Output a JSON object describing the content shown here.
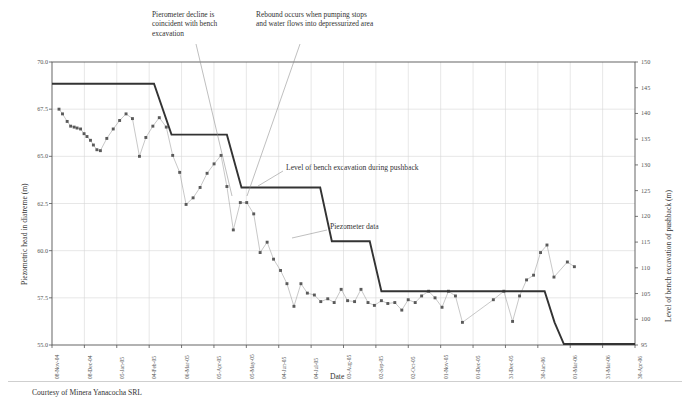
{
  "figure": {
    "credit": "Courtesy of Minera Yanacocha SRL",
    "xlabel": "Date"
  },
  "annotations": {
    "decline": "Pierometer decline is\ncoincident with bench\nexcavation",
    "rebound": "Rebound occurs when pumping stops\nand water flows into depressurized area",
    "bench_label": "Level of bench excavation during pushback",
    "piezo_label": "Piezometer data"
  },
  "chart_data": {
    "type": "line",
    "title": "",
    "xlabel": "Date",
    "ylabel": "Piezometric head in diatreme (m)",
    "y2label": "Level of bench excavation of pushback (m)",
    "ylim": [
      55.0,
      70.0
    ],
    "y2lim": [
      95,
      150
    ],
    "yticks": [
      "55.0",
      "57.5",
      "60.0",
      "62.5",
      "65.0",
      "67.5",
      "70.0"
    ],
    "y2ticks": [
      "95",
      "100",
      "105",
      "110",
      "115",
      "120",
      "125",
      "130",
      "135",
      "140",
      "145",
      "150"
    ],
    "grid": true,
    "legend": "annotated-inline",
    "xticks": [
      "08-Nov-04",
      "08-Dec-04",
      "05-Jan-05",
      "04-Feb-05",
      "06-Mar-05",
      "05-Apr-05",
      "05-May-05",
      "04-Jun-05",
      "04-Jul-05",
      "03-Aug-05",
      "02-Sep-05",
      "02-Oct-05",
      "01-Nov-05",
      "01-Dec-05",
      "31-Dec-05",
      "30-Jan-06",
      "01-Mar-06",
      "31-Mar-06",
      "30-Apr-06"
    ],
    "x_start": "08-Nov-04",
    "x_end": "30-Apr-06",
    "series": [
      {
        "name": "Level of bench excavation during pushback",
        "type": "step",
        "axis": "right",
        "color": "#333333",
        "steps": [
          {
            "x": 0.0,
            "y": 68.85
          },
          {
            "x": 0.175,
            "y": 68.85
          },
          {
            "x": 0.205,
            "y": 66.15
          },
          {
            "x": 0.3,
            "y": 66.15
          },
          {
            "x": 0.325,
            "y": 63.35
          },
          {
            "x": 0.46,
            "y": 63.35
          },
          {
            "x": 0.48,
            "y": 60.5
          },
          {
            "x": 0.545,
            "y": 60.5
          },
          {
            "x": 0.565,
            "y": 57.85
          },
          {
            "x": 0.845,
            "y": 57.85
          },
          {
            "x": 0.862,
            "y": 56.2
          },
          {
            "x": 0.878,
            "y": 55.05
          },
          {
            "x": 1.0,
            "y": 55.05
          }
        ]
      },
      {
        "name": "Piezometer data",
        "type": "scatter-line",
        "axis": "left",
        "color": "#5a5a5a",
        "points": [
          {
            "x": 0.012,
            "y": 67.5
          },
          {
            "x": 0.018,
            "y": 67.25
          },
          {
            "x": 0.026,
            "y": 66.85
          },
          {
            "x": 0.032,
            "y": 66.6
          },
          {
            "x": 0.038,
            "y": 66.55
          },
          {
            "x": 0.043,
            "y": 66.5
          },
          {
            "x": 0.049,
            "y": 66.45
          },
          {
            "x": 0.055,
            "y": 66.2
          },
          {
            "x": 0.06,
            "y": 66.05
          },
          {
            "x": 0.066,
            "y": 65.85
          },
          {
            "x": 0.071,
            "y": 65.6
          },
          {
            "x": 0.077,
            "y": 65.35
          },
          {
            "x": 0.083,
            "y": 65.3
          },
          {
            "x": 0.094,
            "y": 65.95
          },
          {
            "x": 0.105,
            "y": 66.45
          },
          {
            "x": 0.116,
            "y": 66.9
          },
          {
            "x": 0.127,
            "y": 67.25
          },
          {
            "x": 0.138,
            "y": 67.0
          },
          {
            "x": 0.15,
            "y": 65.0
          },
          {
            "x": 0.161,
            "y": 66.0
          },
          {
            "x": 0.173,
            "y": 66.6
          },
          {
            "x": 0.184,
            "y": 67.05
          },
          {
            "x": 0.196,
            "y": 66.55
          },
          {
            "x": 0.207,
            "y": 65.05
          },
          {
            "x": 0.219,
            "y": 64.15
          },
          {
            "x": 0.23,
            "y": 62.45
          },
          {
            "x": 0.242,
            "y": 62.8
          },
          {
            "x": 0.254,
            "y": 63.35
          },
          {
            "x": 0.266,
            "y": 64.1
          },
          {
            "x": 0.278,
            "y": 64.6
          },
          {
            "x": 0.29,
            "y": 65.05
          },
          {
            "x": 0.3,
            "y": 63.4
          },
          {
            "x": 0.311,
            "y": 61.1
          },
          {
            "x": 0.323,
            "y": 62.55
          },
          {
            "x": 0.334,
            "y": 62.55
          },
          {
            "x": 0.346,
            "y": 61.95
          },
          {
            "x": 0.357,
            "y": 59.9
          },
          {
            "x": 0.369,
            "y": 60.45
          },
          {
            "x": 0.38,
            "y": 59.55
          },
          {
            "x": 0.392,
            "y": 58.95
          },
          {
            "x": 0.403,
            "y": 58.25
          },
          {
            "x": 0.415,
            "y": 57.05
          },
          {
            "x": 0.427,
            "y": 58.25
          },
          {
            "x": 0.438,
            "y": 57.75
          },
          {
            "x": 0.45,
            "y": 57.65
          },
          {
            "x": 0.461,
            "y": 57.3
          },
          {
            "x": 0.473,
            "y": 57.45
          },
          {
            "x": 0.484,
            "y": 57.25
          },
          {
            "x": 0.496,
            "y": 57.95
          },
          {
            "x": 0.507,
            "y": 57.35
          },
          {
            "x": 0.519,
            "y": 57.3
          },
          {
            "x": 0.53,
            "y": 57.95
          },
          {
            "x": 0.542,
            "y": 57.25
          },
          {
            "x": 0.553,
            "y": 57.1
          },
          {
            "x": 0.565,
            "y": 57.35
          },
          {
            "x": 0.576,
            "y": 57.2
          },
          {
            "x": 0.588,
            "y": 57.25
          },
          {
            "x": 0.6,
            "y": 56.85
          },
          {
            "x": 0.611,
            "y": 57.4
          },
          {
            "x": 0.623,
            "y": 57.25
          },
          {
            "x": 0.634,
            "y": 57.6
          },
          {
            "x": 0.646,
            "y": 57.85
          },
          {
            "x": 0.657,
            "y": 57.5
          },
          {
            "x": 0.669,
            "y": 57.0
          },
          {
            "x": 0.68,
            "y": 57.85
          },
          {
            "x": 0.692,
            "y": 57.6
          },
          {
            "x": 0.704,
            "y": 56.2
          },
          {
            "x": 0.757,
            "y": 57.4
          },
          {
            "x": 0.775,
            "y": 57.85
          },
          {
            "x": 0.79,
            "y": 56.25
          },
          {
            "x": 0.802,
            "y": 57.6
          },
          {
            "x": 0.814,
            "y": 58.45
          },
          {
            "x": 0.826,
            "y": 58.7
          },
          {
            "x": 0.838,
            "y": 59.9
          },
          {
            "x": 0.849,
            "y": 60.3
          },
          {
            "x": 0.861,
            "y": 58.6
          },
          {
            "x": 0.884,
            "y": 59.4
          },
          {
            "x": 0.896,
            "y": 59.15
          }
        ]
      }
    ]
  }
}
